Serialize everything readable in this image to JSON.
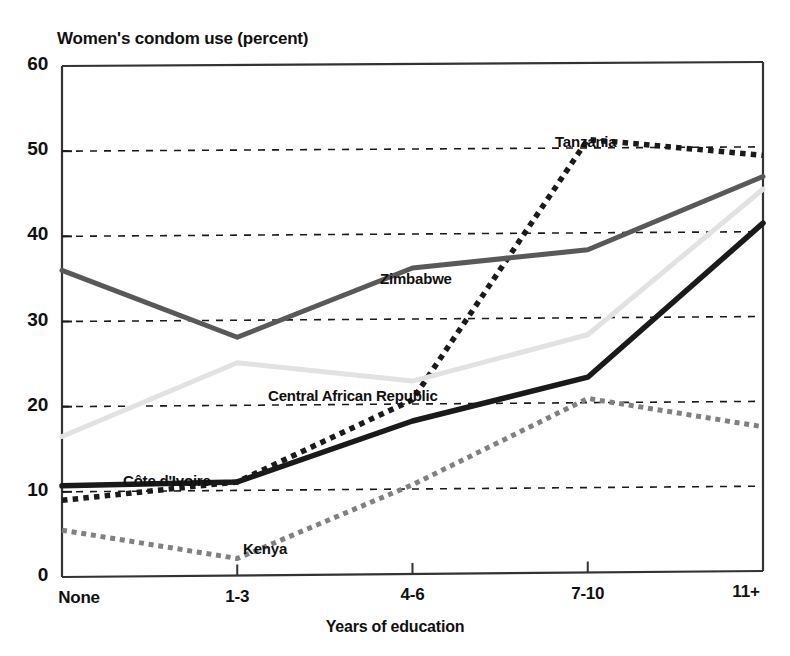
{
  "chart_data": {
    "type": "line",
    "title": "Women's condom use (percent)",
    "xlabel": "Years of education",
    "ylabel": "",
    "categories": [
      "None",
      "1-3",
      "4-6",
      "7-10",
      "11+"
    ],
    "ylim": [
      0,
      60
    ],
    "yticks": [
      0,
      10,
      20,
      30,
      40,
      50,
      60
    ],
    "gridlines": [
      10,
      20,
      30,
      40,
      50
    ],
    "grid": true,
    "legend_position": "inline-labels",
    "series": [
      {
        "name": "Tanzania",
        "values": [
          9,
          11,
          20.5,
          51,
          49
        ],
        "style": "dotted",
        "color": "#1a1a1a",
        "width": 5.5,
        "label_x": 555,
        "label_y": 133
      },
      {
        "name": "Zimbabwe",
        "values": [
          36,
          28,
          36,
          38,
          46.5
        ],
        "style": "solid",
        "color": "#595959",
        "width": 5,
        "label_x": 380,
        "label_y": 270
      },
      {
        "name": "Central African Republic",
        "values": [
          16.5,
          25,
          22.7,
          28,
          45
        ],
        "style": "solid",
        "color": "#e2e2e2",
        "width": 5,
        "label_x": 268,
        "label_y": 387
      },
      {
        "name": "Côte d'Ivoire",
        "values": [
          10.7,
          11,
          18,
          23,
          41
        ],
        "style": "solid",
        "color": "#1a1a1a",
        "width": 5.5,
        "label_x": 123,
        "label_y": 472
      },
      {
        "name": "Kenya",
        "values": [
          5.5,
          2,
          10.5,
          20.5,
          17
        ],
        "style": "dotted",
        "color": "#808080",
        "width": 5,
        "label_x": 243,
        "label_y": 540
      }
    ]
  },
  "axis": {
    "y_tick_labels": [
      "60",
      "50",
      "40",
      "30",
      "20",
      "10",
      "0"
    ],
    "x_tick_labels": [
      "None",
      "1-3",
      "4-6",
      "7-10",
      "11+"
    ]
  }
}
